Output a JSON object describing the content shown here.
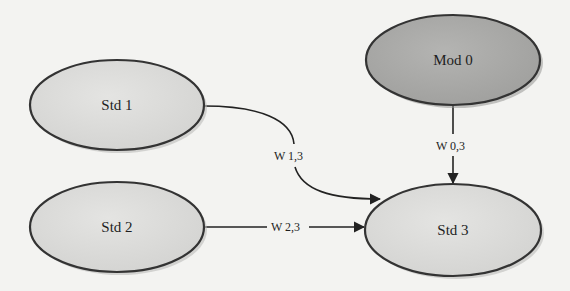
{
  "diagram": {
    "type": "directed-graph",
    "nodes": [
      {
        "id": "std1",
        "label": "Std 1",
        "fill": "#dcdcdc",
        "cx": 117,
        "cy": 105,
        "rx": 87,
        "ry": 45
      },
      {
        "id": "std2",
        "label": "Std 2",
        "fill": "#dcdcdc",
        "cx": 117,
        "cy": 227,
        "rx": 87,
        "ry": 45
      },
      {
        "id": "mod0",
        "label": "Mod 0",
        "fill": "#a9a9a9",
        "cx": 453,
        "cy": 60,
        "rx": 87,
        "ry": 45
      },
      {
        "id": "std3",
        "label": "Std 3",
        "fill": "#dcdcdc",
        "cx": 453,
        "cy": 230,
        "rx": 88,
        "ry": 46
      }
    ],
    "edges": [
      {
        "id": "e13",
        "from": "Std 1",
        "to": "Std 3",
        "label": "W 1,3"
      },
      {
        "id": "e23",
        "from": "Std 2",
        "to": "Std 3",
        "label": "W 2,3"
      },
      {
        "id": "e03",
        "from": "Mod 0",
        "to": "Std 3",
        "label": "W 0,3"
      }
    ],
    "colors": {
      "background": "#f3f3f1",
      "std_fill": "#dcdcdc",
      "mod_fill": "#a9a9a9",
      "stroke": "#333333"
    }
  }
}
